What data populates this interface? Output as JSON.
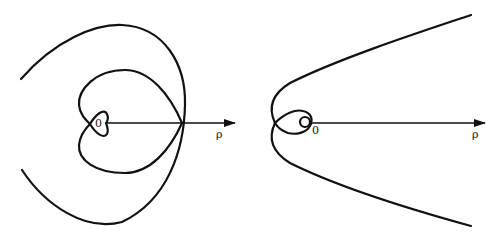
{
  "diagrams": [
    {
      "id": "left",
      "description": "Spiral curve with self-intersections around origin",
      "origin_label": "0",
      "axis_label": "ρ"
    },
    {
      "id": "right",
      "description": "Parabola-like curve with small loop around origin",
      "origin_label": "0",
      "axis_label": "ρ"
    }
  ],
  "colors": {
    "stroke": "#111111",
    "background": "#ffffff"
  }
}
